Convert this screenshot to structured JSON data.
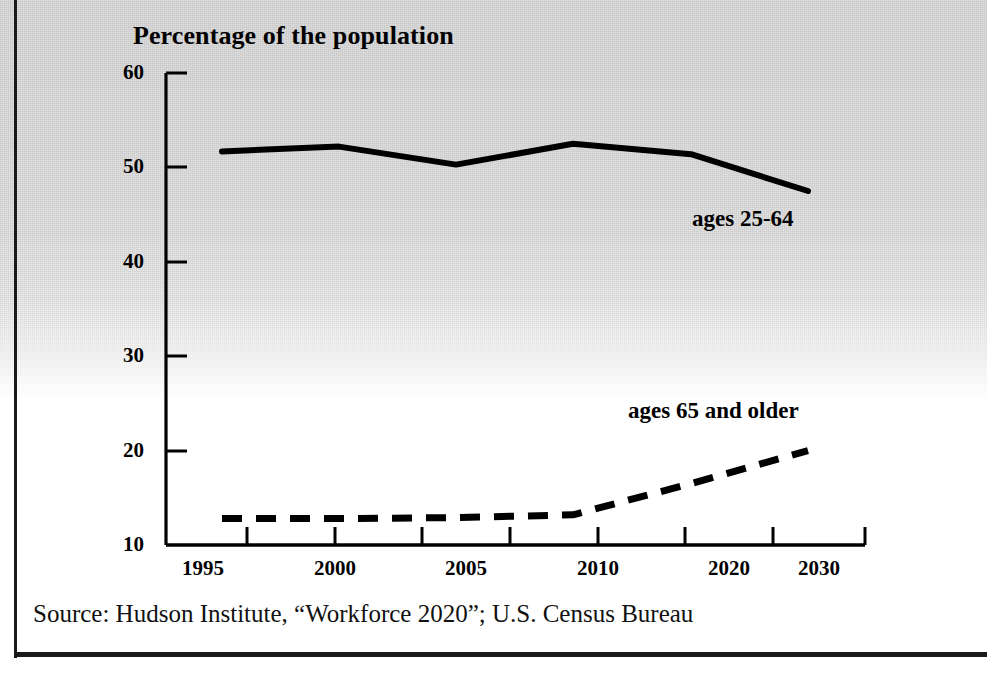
{
  "figure": {
    "title": "Percentage of the population",
    "source": "Source: Hudson Institute, “Workforce 2020”; U.S. Census Bureau"
  },
  "chart_data": {
    "type": "line",
    "title": "Percentage of the population",
    "xlabel": "",
    "ylabel": "Percentage of the population",
    "categories": [
      "1995",
      "2000",
      "2005",
      "2010",
      "2020",
      "2030"
    ],
    "x": [
      1995,
      2000,
      2005,
      2010,
      2020,
      2030
    ],
    "ylim": [
      10,
      60
    ],
    "yticks": [
      10,
      20,
      30,
      40,
      50,
      60
    ],
    "ytick_labels": [
      "10",
      "20",
      "30",
      "40",
      "50",
      "60"
    ],
    "xtick_labels": [
      "1995",
      "2000",
      "2005",
      "2010",
      "2020",
      "2030"
    ],
    "grid": false,
    "legend_position": "inline-annotations",
    "series": [
      {
        "name": "ages 25-64",
        "style": "solid",
        "color": "#000000",
        "values": [
          51.7,
          52.2,
          50.3,
          52.5,
          51.4,
          47.5
        ],
        "annotation": "ages 25-64"
      },
      {
        "name": "ages 65 and older",
        "style": "dashed",
        "color": "#000000",
        "values": [
          12.8,
          12.8,
          12.9,
          13.2,
          16.5,
          20.0
        ],
        "annotation": "ages 65 and older"
      }
    ],
    "annotations": [
      {
        "text": "ages 25-64",
        "series": "ages 25-64"
      },
      {
        "text": "ages 65 and older",
        "series": "ages 65 and older"
      }
    ]
  },
  "axes": {
    "y_tick_labels": [
      "60",
      "50",
      "40",
      "30",
      "20",
      "10"
    ],
    "x_tick_labels": [
      "1995",
      "2000",
      "2005",
      "2010",
      "2020",
      "2030"
    ]
  }
}
